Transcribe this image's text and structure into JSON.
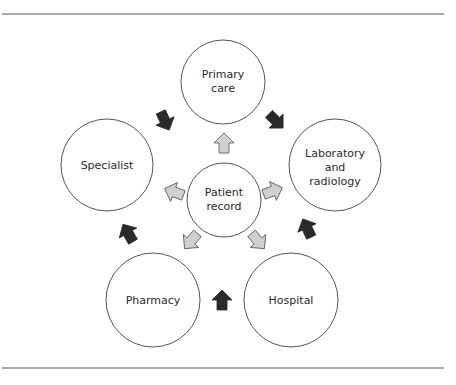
{
  "diagram": {
    "type": "hub-and-ring flow diagram",
    "colors": {
      "rule": "#555555",
      "circle_stroke": "#555555",
      "circle_fill": "#ffffff",
      "hub_arrow_fill": "#d0d0d0",
      "hub_arrow_stroke": "#555555",
      "ring_arrow_fill": "#2a2a2a",
      "text": "#2a2a2a"
    },
    "hub": {
      "id": "patient-record",
      "lines": [
        "Patient",
        "record"
      ]
    },
    "nodes": [
      {
        "id": "primary-care",
        "lines": [
          "Primary",
          "care"
        ]
      },
      {
        "id": "laboratory-radiology",
        "lines": [
          "Laboratory",
          "and",
          "radiology"
        ]
      },
      {
        "id": "hospital",
        "lines": [
          "Hospital"
        ]
      },
      {
        "id": "pharmacy",
        "lines": [
          "Pharmacy"
        ]
      },
      {
        "id": "specialist",
        "lines": [
          "Specialist"
        ]
      }
    ],
    "hub_arrows": [
      {
        "from": "patient-record",
        "to": "primary-care",
        "style": "light-gray"
      },
      {
        "from": "patient-record",
        "to": "laboratory-radiology",
        "style": "light-gray"
      },
      {
        "from": "patient-record",
        "to": "hospital",
        "style": "light-gray"
      },
      {
        "from": "patient-record",
        "to": "pharmacy",
        "style": "light-gray"
      },
      {
        "from": "patient-record",
        "to": "specialist",
        "style": "light-gray"
      }
    ],
    "ring_arrows": [
      {
        "from": "primary-care",
        "to": "laboratory-radiology",
        "style": "dark"
      },
      {
        "from": "laboratory-radiology",
        "to": "hospital",
        "style": "dark",
        "note": "points up toward laboratory"
      },
      {
        "from": "hospital",
        "to": "pharmacy",
        "style": "dark",
        "note": "points up"
      },
      {
        "from": "pharmacy",
        "to": "specialist",
        "style": "dark"
      },
      {
        "from": "specialist",
        "to": "primary-care",
        "style": "dark"
      }
    ]
  }
}
